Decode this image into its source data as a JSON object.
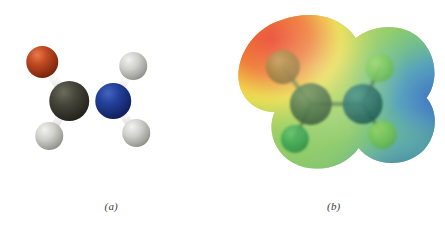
{
  "figure": {
    "background": "#ffffff",
    "width": 445,
    "height": 231,
    "panels": [
      {
        "id": "a",
        "label": "(a)",
        "kind": "ball-and-stick-model",
        "molecule": "formamide",
        "bond_color": "#e8e8ea",
        "atoms": [
          {
            "element": "O",
            "name": "oxygen",
            "cx": 42,
            "cy": 62,
            "r": 16,
            "color": "#b03a18",
            "highlight": "#e0features"
          },
          {
            "element": "C",
            "name": "carbon",
            "cx": 69,
            "cy": 101,
            "r": 20,
            "color": "#3c3c33"
          },
          {
            "element": "N",
            "name": "nitrogen",
            "cx": 113,
            "cy": 101,
            "r": 18,
            "color": "#1b3a8c"
          },
          {
            "element": "H",
            "name": "hydrogen-formyl",
            "cx": 49,
            "cy": 136,
            "r": 14,
            "color": "#c9c9c9"
          },
          {
            "element": "H",
            "name": "hydrogen-amine-upper",
            "cx": 133,
            "cy": 66,
            "r": 14,
            "color": "#c9c9c9"
          },
          {
            "element": "H",
            "name": "hydrogen-amine-lower",
            "cx": 136,
            "cy": 133,
            "r": 14,
            "color": "#c9c9c9"
          }
        ],
        "bonds": [
          {
            "name": "bond-c-o",
            "from": "C",
            "to": "O",
            "order": 2
          },
          {
            "name": "bond-c-n",
            "from": "C",
            "to": "N",
            "order": 1
          },
          {
            "name": "bond-c-h",
            "from": "C",
            "to": "H",
            "order": 1
          },
          {
            "name": "bond-n-h-upper",
            "from": "N",
            "to": "H",
            "order": 1
          },
          {
            "name": "bond-n-h-lower",
            "from": "N",
            "to": "H",
            "order": 1
          }
        ]
      },
      {
        "id": "b",
        "label": "(b)",
        "kind": "electrostatic-potential-map",
        "molecule": "formamide",
        "surface_colors": {
          "most_negative": "#e23b1e",
          "negative": "#f07a22",
          "slightly_negative": "#f2e33a",
          "neutral": "#7fc24a",
          "slightly_positive": "#3fae8e",
          "positive": "#3f8fd0",
          "most_positive": "#2b5fc0"
        },
        "atoms": [
          {
            "element": "O",
            "name": "oxygen",
            "cx": 60,
            "cy": 67,
            "r": 17,
            "color": "#8a6b1e"
          },
          {
            "element": "C",
            "name": "carbon",
            "cx": 88,
            "cy": 104,
            "r": 21,
            "color": "#2e5c2a"
          },
          {
            "element": "N",
            "name": "nitrogen",
            "cx": 140,
            "cy": 104,
            "r": 20,
            "color": "#176058"
          },
          {
            "element": "H",
            "name": "hydrogen-formyl",
            "cx": 72,
            "cy": 139,
            "r": 14,
            "color": "#33a04a"
          },
          {
            "element": "H",
            "name": "hydrogen-amine-upper",
            "cx": 157,
            "cy": 68,
            "r": 14,
            "color": "#6dc24a"
          },
          {
            "element": "H",
            "name": "hydrogen-amine-lower",
            "cx": 160,
            "cy": 135,
            "r": 14,
            "color": "#5cbb57"
          }
        ]
      }
    ]
  }
}
